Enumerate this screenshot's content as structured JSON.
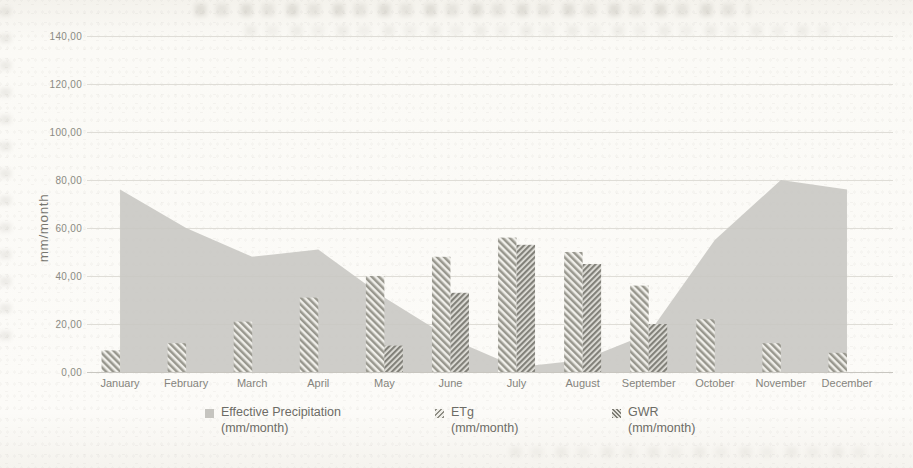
{
  "chart_data": {
    "type": "combo-area-bar",
    "categories": [
      "January",
      "February",
      "March",
      "April",
      "May",
      "June",
      "July",
      "August",
      "September",
      "October",
      "November",
      "December"
    ],
    "series": [
      {
        "name": "Effective Precipitation",
        "unit_label": "(mm/month)",
        "chart": "area",
        "color": "#c9c8c3",
        "values": [
          76,
          60,
          48,
          51,
          31,
          14,
          2,
          5,
          16,
          55,
          80,
          76
        ]
      },
      {
        "name": "ETg",
        "unit_label": "(mm/month)",
        "chart": "bar",
        "pattern": "diagonal-hatch",
        "values": [
          9,
          12,
          21,
          31,
          40,
          48,
          56,
          50,
          36,
          22,
          12,
          8
        ]
      },
      {
        "name": "GWR",
        "unit_label": "(mm/month)",
        "chart": "bar",
        "pattern": "dense-diagonal-hatch",
        "values": [
          0,
          0,
          0,
          0,
          11,
          33,
          53,
          45,
          20,
          0,
          0,
          0
        ]
      }
    ],
    "ylabel": "mm/month",
    "ylim": [
      0,
      140
    ],
    "ytick_step": 20,
    "ytick_labels": [
      "0,00",
      "20,00",
      "40,00",
      "60,00",
      "80,00",
      "100,00",
      "120,00",
      "140,00"
    ],
    "grid": true,
    "legend_position": "bottom"
  }
}
